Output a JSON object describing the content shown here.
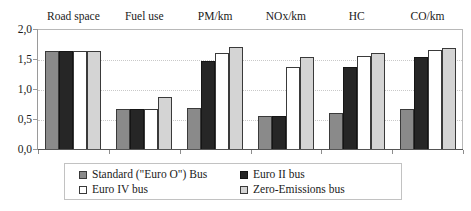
{
  "chart_data": {
    "type": "bar",
    "title": "",
    "subtitle": "",
    "xlabel": "",
    "ylabel": "",
    "ylim": [
      0.0,
      2.0
    ],
    "ytick_labels": [
      "0,0",
      "0,5",
      "1,0",
      "1,5",
      "2,0"
    ],
    "ytick_values": [
      0.0,
      0.5,
      1.0,
      1.5,
      2.0
    ],
    "grid": "horizontal-dotted",
    "legend_position": "bottom",
    "category_label_position": "top",
    "categories": [
      "Road space",
      "Fuel use",
      "PM/km",
      "NOx/km",
      "HC",
      "CO/km"
    ],
    "series": [
      {
        "name": "Standard (\"Euro O\") Bus",
        "color": "#8a8a8a",
        "values": [
          1.64,
          0.67,
          0.69,
          0.55,
          0.6,
          0.67
        ]
      },
      {
        "name": "Euro II bus",
        "color": "#262626",
        "values": [
          1.64,
          0.67,
          1.46,
          0.55,
          1.37,
          1.53
        ]
      },
      {
        "name": "Euro IV bus",
        "color": "#ffffff",
        "values": [
          1.64,
          0.67,
          1.6,
          1.36,
          1.55,
          1.65
        ]
      },
      {
        "name": "Zero-Emissions bus",
        "color": "#d4d4d4",
        "values": [
          1.64,
          0.86,
          1.7,
          1.54,
          1.6,
          1.68
        ]
      }
    ]
  }
}
